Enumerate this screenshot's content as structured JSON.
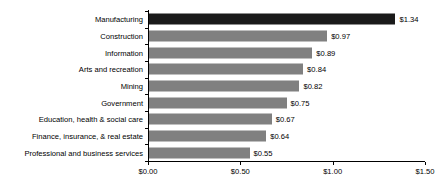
{
  "chart_data": {
    "type": "bar",
    "orientation": "horizontal",
    "title": "",
    "subtitle": "",
    "xlabel": "",
    "ylabel": "",
    "xlim": [
      0,
      1.5
    ],
    "grid": false,
    "legend": false,
    "axis": {
      "ticks": [
        0,
        0.5,
        1.0,
        1.5
      ],
      "tick_labels": [
        "$0.00",
        "$0.50",
        "$1.00",
        "$1.50"
      ],
      "prefix": "$"
    },
    "colors": {
      "bar_default": "#808080",
      "bar_highlight": "#1a1a1a",
      "axis": "#000000",
      "text": "#000000",
      "background": "#ffffff"
    },
    "categories": [
      "Manufacturing",
      "Construction",
      "Information",
      "Arts and recreation",
      "Mining",
      "Government",
      "Education, health & social care",
      "Finance, insurance, & real estate",
      "Professional and business services"
    ],
    "values": [
      1.34,
      0.97,
      0.89,
      0.84,
      0.82,
      0.75,
      0.67,
      0.64,
      0.55
    ],
    "value_labels": [
      "$1.34",
      "$0.97",
      "$0.89",
      "$0.84",
      "$0.82",
      "$0.75",
      "$0.67",
      "$0.64",
      "$0.55"
    ],
    "highlight_index": 0
  }
}
